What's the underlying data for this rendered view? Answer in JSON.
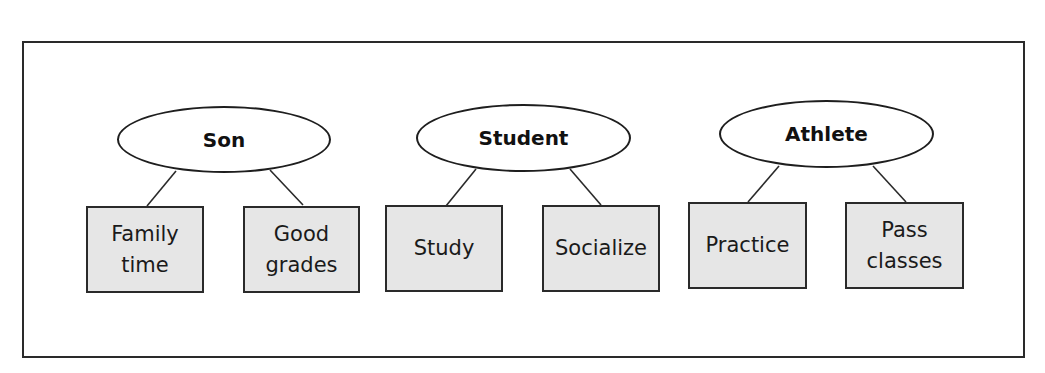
{
  "diagram": {
    "type": "role-goals tree",
    "colors": {
      "box_fill": "#e6e6e6",
      "stroke": "#2a2a2a",
      "background": "#ffffff"
    },
    "roles": [
      {
        "label": "Son",
        "goals": [
          {
            "label": "Family\ntime"
          },
          {
            "label": "Good\ngrades"
          }
        ]
      },
      {
        "label": "Student",
        "goals": [
          {
            "label": "Study"
          },
          {
            "label": "Socialize"
          }
        ]
      },
      {
        "label": "Athlete",
        "goals": [
          {
            "label": "Practice"
          },
          {
            "label": "Pass\nclasses"
          }
        ]
      }
    ]
  }
}
